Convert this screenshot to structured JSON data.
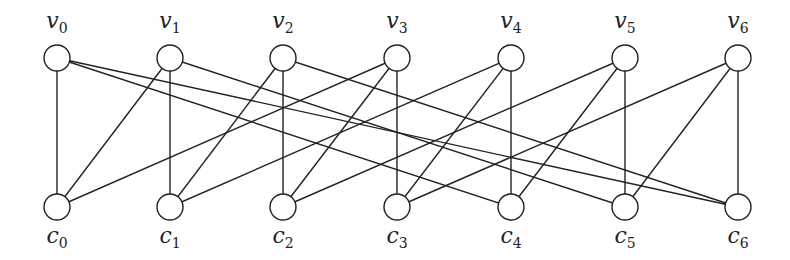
{
  "graph": {
    "top_nodes": [
      {
        "id": "v0",
        "name": "v",
        "sub": "0",
        "x": 57
      },
      {
        "id": "v1",
        "name": "v",
        "sub": "1",
        "x": 170
      },
      {
        "id": "v2",
        "name": "v",
        "sub": "2",
        "x": 283
      },
      {
        "id": "v3",
        "name": "v",
        "sub": "3",
        "x": 397
      },
      {
        "id": "v4",
        "name": "v",
        "sub": "4",
        "x": 511
      },
      {
        "id": "v5",
        "name": "v",
        "sub": "5",
        "x": 625
      },
      {
        "id": "v6",
        "name": "v",
        "sub": "6",
        "x": 738
      }
    ],
    "bottom_nodes": [
      {
        "id": "c0",
        "name": "c",
        "sub": "0",
        "x": 57
      },
      {
        "id": "c1",
        "name": "c",
        "sub": "1",
        "x": 170
      },
      {
        "id": "c2",
        "name": "c",
        "sub": "2",
        "x": 283
      },
      {
        "id": "c3",
        "name": "c",
        "sub": "3",
        "x": 397
      },
      {
        "id": "c4",
        "name": "c",
        "sub": "4",
        "x": 511
      },
      {
        "id": "c5",
        "name": "c",
        "sub": "5",
        "x": 625
      },
      {
        "id": "c6",
        "name": "c",
        "sub": "6",
        "x": 738
      }
    ],
    "edges": [
      [
        0,
        0
      ],
      [
        0,
        6
      ],
      [
        0,
        4
      ],
      [
        1,
        1
      ],
      [
        1,
        0
      ],
      [
        1,
        5
      ],
      [
        2,
        2
      ],
      [
        2,
        1
      ],
      [
        2,
        6
      ],
      [
        3,
        3
      ],
      [
        3,
        2
      ],
      [
        3,
        0
      ],
      [
        4,
        4
      ],
      [
        4,
        3
      ],
      [
        4,
        1
      ],
      [
        5,
        5
      ],
      [
        5,
        4
      ],
      [
        5,
        2
      ],
      [
        6,
        6
      ],
      [
        6,
        5
      ],
      [
        6,
        3
      ]
    ],
    "top_y": 58,
    "bottom_y": 207,
    "radius": 13,
    "stroke_color": "#222222"
  }
}
